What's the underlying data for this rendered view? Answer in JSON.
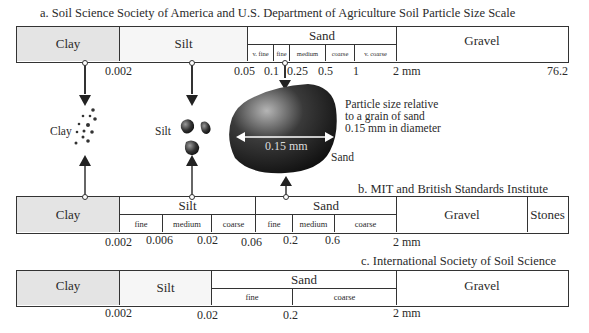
{
  "scale_a": {
    "title": "a. Soil Science Society of America and U.S. Department of Agriculture Soil Particle Size Scale",
    "classes": {
      "clay": "Clay",
      "silt": "Silt",
      "sand": "Sand",
      "gravel": "Gravel"
    },
    "sand_sub": [
      "v. fine",
      "fine",
      "medium",
      "coarse",
      "v. coarse"
    ],
    "ticks": [
      "0.002",
      "0.05",
      "0.1",
      "0.25",
      "0.5",
      "1",
      "2 mm",
      "76.2"
    ]
  },
  "illustration": {
    "clay_label": "Clay",
    "silt_label": "Silt",
    "sand_label": "Sand",
    "grain_dimension": "0.15 mm",
    "caption_lines": [
      "Particle size relative",
      "to a grain of sand",
      "0.15 mm in diameter"
    ]
  },
  "scale_b": {
    "title": "b. MIT and British Standards Institute",
    "classes": {
      "clay": "Clay",
      "silt": "Silt",
      "sand": "Sand",
      "gravel": "Gravel",
      "stones": "Stones"
    },
    "silt_sub": [
      "fine",
      "medium",
      "coarse"
    ],
    "sand_sub": [
      "fine",
      "medium",
      "coarse"
    ],
    "ticks": [
      "0.002",
      "0.006",
      "0.02",
      "0.06",
      "0.2",
      "0.6",
      "2 mm"
    ]
  },
  "scale_c": {
    "title": "c. International Society of Soil Science",
    "classes": {
      "clay": "Clay",
      "silt": "Silt",
      "sand": "Sand",
      "gravel": "Gravel"
    },
    "sand_sub": [
      "fine",
      "coarse"
    ],
    "ticks": [
      "0.002",
      "0.02",
      "0.2",
      "2 mm"
    ]
  }
}
